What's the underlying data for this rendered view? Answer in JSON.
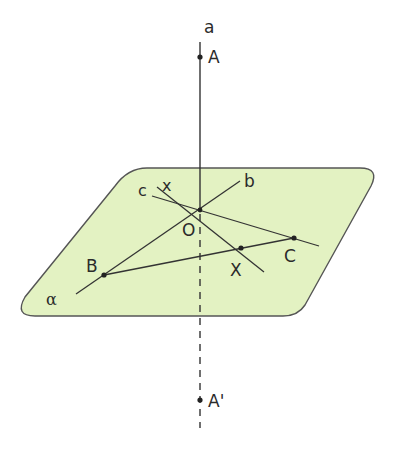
{
  "diagram": {
    "colors": {
      "plane_fill": "#e3f2c2",
      "plane_stroke": "#555555",
      "line_stroke": "#333333",
      "point_fill": "#222222"
    },
    "plane": {
      "label": "α"
    },
    "labels": {
      "a": "a",
      "A": "A",
      "A_prime": "A'",
      "O": "O",
      "b": "b",
      "c": "c",
      "x": "x",
      "B": "B",
      "C": "C",
      "X": "X"
    },
    "points": [
      {
        "name": "A",
        "x": 200,
        "y": 57
      },
      {
        "name": "O",
        "x": 200,
        "y": 210
      },
      {
        "name": "B",
        "x": 104,
        "y": 275
      },
      {
        "name": "C",
        "x": 294,
        "y": 238
      },
      {
        "name": "X",
        "x": 241,
        "y": 248
      },
      {
        "name": "A'",
        "x": 200,
        "y": 400
      }
    ],
    "lines": [
      {
        "name": "a",
        "from": [
          200,
          42
        ],
        "to": [
          200,
          425
        ],
        "style": "solid above plane, dashed below plane"
      },
      {
        "name": "b",
        "from": [
          76,
          294
        ],
        "to": [
          240,
          181
        ]
      },
      {
        "name": "c",
        "from": [
          152,
          196
        ],
        "to": [
          319,
          246
        ]
      },
      {
        "name": "x",
        "from": [
          157,
          187
        ],
        "to": [
          264,
          272
        ]
      },
      {
        "name": "BC",
        "from": [
          104,
          275
        ],
        "to": [
          294,
          238
        ]
      }
    ]
  }
}
